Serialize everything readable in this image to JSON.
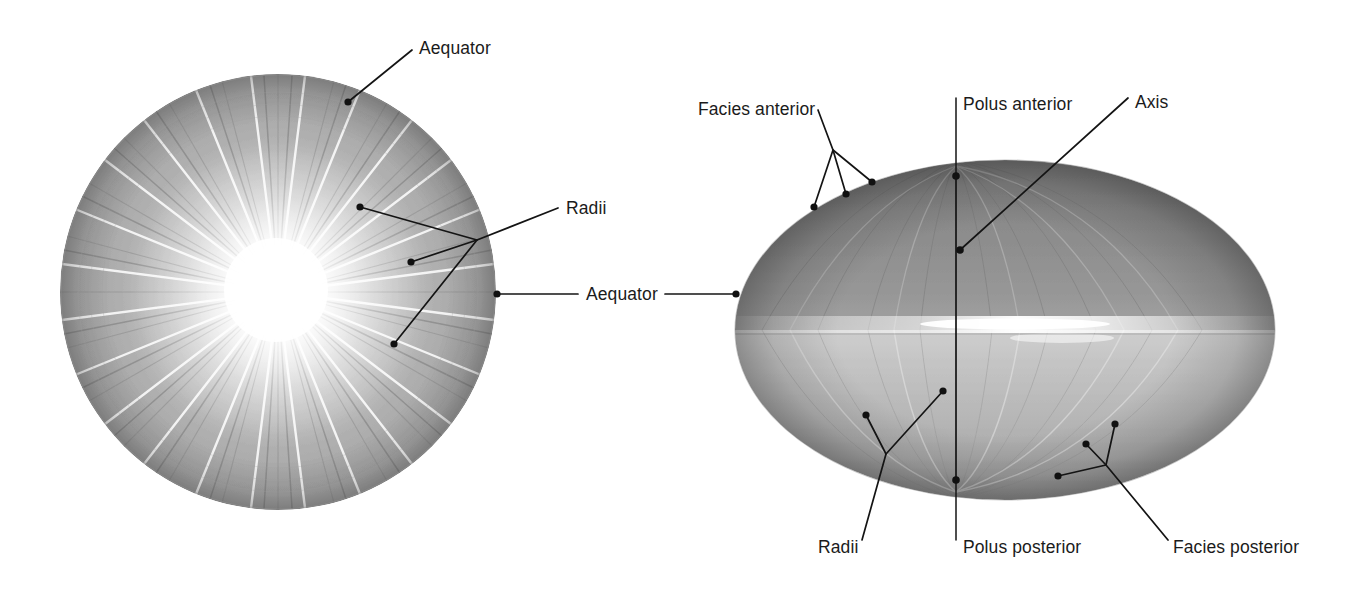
{
  "figure": {
    "background_color": "#ffffff",
    "label_color": "#1b1b1b",
    "leader_color": "#141414",
    "width": 1347,
    "height": 589
  },
  "specimens": [
    {
      "id": "anterior-view",
      "name": "Lens anterior surface (facies anterior), en face",
      "shape": "circle",
      "center": {
        "x": 278,
        "y": 292
      },
      "radius": 218,
      "description": "Round lens seen from the front with radiating suture lines (radii) converging on a bright central star",
      "tone_outer": "#9a9a9a",
      "tone_inner": "#ffffff"
    },
    {
      "id": "equatorial-view",
      "name": "Lens seen from the side (equatorial view)",
      "shape": "ellipse",
      "center": {
        "x": 1005,
        "y": 330
      },
      "radius_x": 270,
      "radius_y": 170,
      "description": "Biconvex lens in profile: anterior face above the equator, posterior face below, with the equatorial highlight band",
      "tone_outer": "#8d8d8d",
      "tone_inner": "#f2f2f2"
    }
  ],
  "labels": [
    {
      "key": "aequator_left",
      "text": "Aequator",
      "x": 419,
      "y": 54,
      "anchor": "start",
      "target": "anterior-view"
    },
    {
      "key": "radii_left",
      "text": "Radii",
      "x": 566,
      "y": 214,
      "anchor": "start",
      "target": "anterior-view"
    },
    {
      "key": "aequator_center",
      "text": "Aequator",
      "x": 586,
      "y": 300,
      "anchor": "start",
      "target": "both"
    },
    {
      "key": "facies_anterior",
      "text": "Facies anterior",
      "x": 698,
      "y": 115,
      "anchor": "start",
      "target": "equatorial-view"
    },
    {
      "key": "polus_anterior",
      "text": "Polus anterior",
      "x": 963,
      "y": 110,
      "anchor": "start",
      "target": "equatorial-view"
    },
    {
      "key": "axis",
      "text": "Axis",
      "x": 1135,
      "y": 108,
      "anchor": "start",
      "target": "equatorial-view"
    },
    {
      "key": "radii_right",
      "text": "Radii",
      "x": 818,
      "y": 553,
      "anchor": "start",
      "target": "equatorial-view"
    },
    {
      "key": "polus_posterior",
      "text": "Polus posterior",
      "x": 963,
      "y": 553,
      "anchor": "start",
      "target": "equatorial-view"
    },
    {
      "key": "facies_posterior",
      "text": "Facies posterior",
      "x": 1173,
      "y": 553,
      "anchor": "start",
      "target": "equatorial-view"
    }
  ],
  "leaders": [
    {
      "key": "aequator_left",
      "points": "412,50 348,102",
      "end_dots": [
        {
          "x": 348,
          "y": 102
        }
      ]
    },
    {
      "key": "radii_left_branch_a",
      "points": "558,208 477,240 360,207",
      "end_dots": [
        {
          "x": 360,
          "y": 207
        }
      ]
    },
    {
      "key": "radii_left_branch_b",
      "points": "477,240 411,262",
      "end_dots": [
        {
          "x": 411,
          "y": 262
        }
      ]
    },
    {
      "key": "radii_left_branch_c",
      "points": "477,240 394,344",
      "end_dots": [
        {
          "x": 394,
          "y": 344
        }
      ]
    },
    {
      "key": "aequator_center_left_arm",
      "points": "497,294 578,294",
      "end_dots": [
        {
          "x": 497,
          "y": 294
        }
      ]
    },
    {
      "key": "aequator_center_right_arm",
      "points": "665,294 736,294",
      "end_dots": [
        {
          "x": 736,
          "y": 294
        }
      ]
    },
    {
      "key": "facies_anterior_branch_a",
      "points": "818,110 833,150 814,207",
      "end_dots": [
        {
          "x": 814,
          "y": 207
        }
      ]
    },
    {
      "key": "facies_anterior_branch_b",
      "points": "833,150 846,194",
      "end_dots": [
        {
          "x": 846,
          "y": 194
        }
      ]
    },
    {
      "key": "facies_anterior_branch_c",
      "points": "833,150 872,182",
      "end_dots": [
        {
          "x": 872,
          "y": 182
        }
      ]
    },
    {
      "key": "polus_anterior_stem",
      "points": "956,98 956,176",
      "end_dots": [
        {
          "x": 956,
          "y": 176
        }
      ]
    },
    {
      "key": "axis_leader",
      "points": "1128,98 960,250",
      "end_dots": [
        {
          "x": 960,
          "y": 250
        }
      ]
    },
    {
      "key": "axis_line",
      "points": "956,176 956,480",
      "end_dots": []
    },
    {
      "key": "radii_right_branch_a",
      "points": "862,540 886,454 866,415",
      "end_dots": [
        {
          "x": 866,
          "y": 415
        }
      ]
    },
    {
      "key": "radii_right_branch_b",
      "points": "886,454 943,391",
      "end_dots": [
        {
          "x": 943,
          "y": 391
        }
      ]
    },
    {
      "key": "polus_posterior_stem",
      "points": "956,540 956,480",
      "end_dots": [
        {
          "x": 956,
          "y": 480
        }
      ]
    },
    {
      "key": "facies_posterior_branch_a",
      "points": "1168,540 1106,465 1115,424",
      "end_dots": [
        {
          "x": 1115,
          "y": 424
        }
      ]
    },
    {
      "key": "facies_posterior_branch_b",
      "points": "1106,465 1086,444",
      "end_dots": [
        {
          "x": 1086,
          "y": 444
        }
      ]
    },
    {
      "key": "facies_posterior_branch_c",
      "points": "1106,465 1058,476",
      "end_dots": [
        {
          "x": 1058,
          "y": 476
        }
      ]
    }
  ]
}
